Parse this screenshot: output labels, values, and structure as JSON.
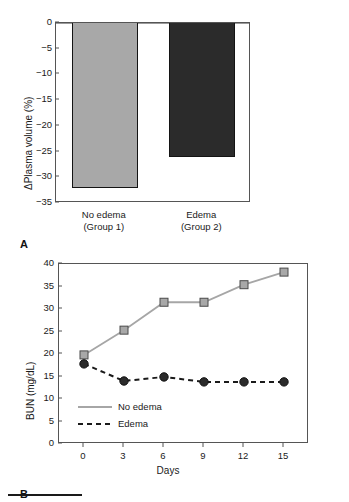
{
  "figure": {
    "panel_a_letter": "A",
    "panel_b_letter": "B",
    "top_fragment": ""
  },
  "chart_data": [
    {
      "type": "bar",
      "panel": "A",
      "title": "",
      "xlabel": "",
      "ylabel": "ΔPlasma volume (%)",
      "categories": [
        "No edema\n(Group 1)",
        "Edema\n(Group 2)"
      ],
      "category_lines": [
        [
          "No edema",
          "(Group 1)"
        ],
        [
          "Edema",
          "(Group 2)"
        ]
      ],
      "values": [
        -32,
        -26
      ],
      "ylim": [
        -35,
        0
      ],
      "yticks": [
        0,
        -5,
        -10,
        -15,
        -20,
        -25,
        -30,
        -35
      ],
      "ytick_labels": [
        "0",
        "−5",
        "−10",
        "−15",
        "−20",
        "−25",
        "−30",
        "−35"
      ],
      "bar_colors": [
        "#a8a8a8",
        "#2b2b2b"
      ],
      "grid": false,
      "legend": null
    },
    {
      "type": "line",
      "panel": "B",
      "title": "",
      "xlabel": "Days",
      "ylabel": "BUN (mg/dL)",
      "x": [
        0,
        3,
        6,
        9,
        12,
        15
      ],
      "xtick_labels": [
        "0",
        "3",
        "6",
        "9",
        "12",
        "15"
      ],
      "xlim": [
        0,
        15
      ],
      "ylim": [
        0,
        40
      ],
      "yticks": [
        0,
        5,
        10,
        15,
        20,
        25,
        30,
        35,
        40
      ],
      "ytick_labels": [
        "0",
        "5",
        "10",
        "15",
        "20",
        "25",
        "30",
        "35",
        "40"
      ],
      "grid": false,
      "legend_position": "bottom-left",
      "series": [
        {
          "name": "No edema",
          "values": [
            19.8,
            25.3,
            31.5,
            31.5,
            35.4,
            38.2
          ],
          "color": "#a6a6a6",
          "marker": "square-open",
          "marker_fill": "#a8a8a8",
          "marker_edge": "#4a4a4a",
          "line_style": "solid"
        },
        {
          "name": "Edema",
          "values": [
            17.8,
            14.0,
            14.9,
            13.8,
            13.8,
            13.8
          ],
          "color": "#1a1a1a",
          "marker": "circle-filled",
          "marker_fill": "#2b2b2b",
          "marker_edge": "#111111",
          "line_style": "dashed"
        }
      ]
    }
  ]
}
